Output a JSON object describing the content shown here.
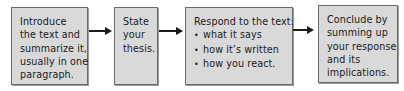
{
  "diagram": {
    "type": "flowchart",
    "direction": "left-to-right",
    "colors": {
      "box_fill": "#d9d9d9",
      "box_border": "#6a6a6a",
      "arrow": "#1a1a1a",
      "text": "#1a1a1a"
    },
    "steps": [
      {
        "id": "introduce",
        "lines": [
          "Introduce",
          "the text and",
          "summarize it,",
          "usually in one",
          "paragraph."
        ]
      },
      {
        "id": "thesis",
        "lines": [
          "State",
          "your",
          "thesis."
        ]
      },
      {
        "id": "respond",
        "heading": "Respond to the text:",
        "bullets": [
          "what it says",
          "how it’s written",
          "how you react."
        ],
        "bullet_icon": "•"
      },
      {
        "id": "conclude",
        "lines": [
          "Conclude by",
          "summing up",
          "your response",
          "and its",
          "implications."
        ]
      }
    ],
    "arrows": [
      {
        "from": "introduce",
        "to": "thesis"
      },
      {
        "from": "thesis",
        "to": "respond"
      },
      {
        "from": "respond",
        "to": "conclude"
      }
    ]
  }
}
